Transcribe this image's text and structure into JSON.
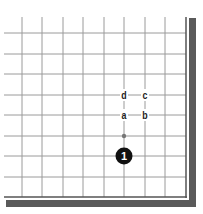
{
  "diagram": {
    "type": "go-board-corner",
    "corner": "bottom-right",
    "vertical_lines_x": [
      22,
      42,
      63,
      83,
      104,
      124,
      145,
      165
    ],
    "horizontal_lines_y": [
      33,
      54,
      74,
      95,
      115,
      136,
      156,
      177
    ],
    "edge_right_x": 186,
    "edge_bottom_y": 197,
    "grid_top_y": 17,
    "grid_left_x": 4,
    "colors": {
      "grid": "#9a9a9a",
      "border_thin": "#555555",
      "border_thick": "#5a5a5a",
      "stone_black": "#111111",
      "label": "#222222"
    },
    "stones": [
      {
        "color": "black",
        "number": "1",
        "x": 124,
        "y": 156
      }
    ],
    "markers": [
      {
        "kind": "dot",
        "x": 124,
        "y": 136
      }
    ],
    "labels": [
      {
        "text": "d",
        "x": 124,
        "y": 95
      },
      {
        "text": "c",
        "x": 145,
        "y": 95
      },
      {
        "text": "a",
        "x": 124,
        "y": 115
      },
      {
        "text": "b",
        "x": 145,
        "y": 115
      }
    ]
  }
}
